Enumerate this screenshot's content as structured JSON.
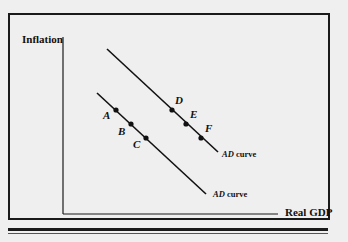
{
  "diagram": {
    "y_axis_label": "Inflation",
    "x_axis_label": "Real GDP",
    "curves": [
      {
        "id": "lower",
        "label_prefix": "AD",
        "label_suffix": " curve",
        "points": [
          "A",
          "B",
          "C"
        ]
      },
      {
        "id": "upper",
        "label_prefix": "AD",
        "label_suffix": " curve",
        "points": [
          "D",
          "E",
          "F"
        ]
      }
    ],
    "points": {
      "A": "A",
      "B": "B",
      "C": "C",
      "D": "D",
      "E": "E",
      "F": "F"
    },
    "colors": {
      "ink": "#111111",
      "background": "#efefef"
    }
  }
}
